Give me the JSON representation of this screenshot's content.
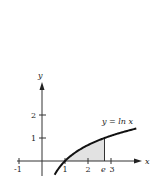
{
  "chart_data": {
    "type": "line",
    "title": "",
    "xlabel": "x",
    "ylabel": "y",
    "curve_label": "y = ln x",
    "function": "ln(x)",
    "xlim": [
      -1,
      3.8
    ],
    "ylim": [
      -0.7,
      3.4
    ],
    "x_ticks": [
      {
        "value": -1,
        "label": "-1"
      },
      {
        "value": 1,
        "label": "1"
      },
      {
        "value": 2,
        "label": "2"
      },
      {
        "value": 2.718,
        "label": "e"
      },
      {
        "value": 3,
        "label": "3"
      }
    ],
    "y_ticks": [
      {
        "value": 1,
        "label": "1"
      },
      {
        "value": 2,
        "label": "2"
      }
    ],
    "shaded_region": {
      "from_x": 1,
      "to_x": 2.718,
      "description": "area under y = ln x from 1 to e"
    },
    "vertical_line": {
      "x": 2.718,
      "y_top": 1
    },
    "grid": false,
    "legend": "none"
  },
  "colors": {
    "curve": "#111111",
    "axis": "#333333",
    "shade": "#e2e2e2"
  }
}
